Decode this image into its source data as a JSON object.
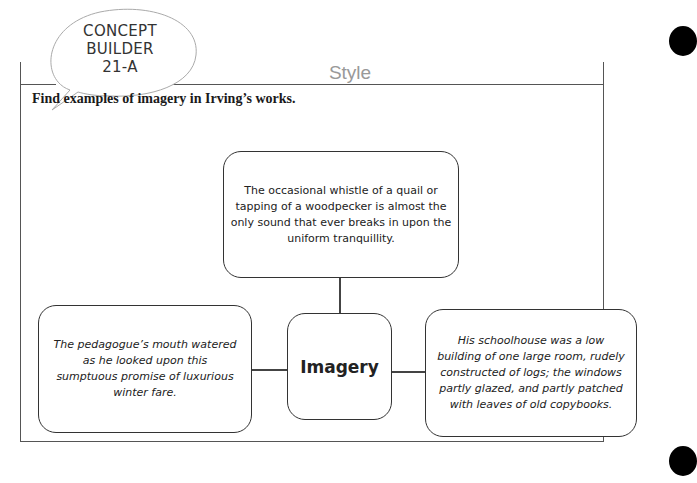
{
  "header": {
    "badge_lines": [
      "CONCEPT",
      "BUILDER",
      "21-A"
    ],
    "section_title": "Style"
  },
  "instruction": "Find examples of imagery in Irving’s works.",
  "organizer": {
    "center_label": "Imagery",
    "top_example": "The occasional whistle of a quail or tapping of a woodpecker is almost the only sound that ever breaks in upon the uniform tranquillity.",
    "left_example": "The pedagogue’s mouth watered as he looked upon this sumptuous promise of luxurious winter fare.",
    "right_example": "His schoolhouse was a low building of one large room, rudely constructed of logs; the windows partly glazed, and partly patched with leaves of old copybooks."
  },
  "colors": {
    "frame": "#555555",
    "title_gray": "#999999",
    "text": "#222222"
  }
}
